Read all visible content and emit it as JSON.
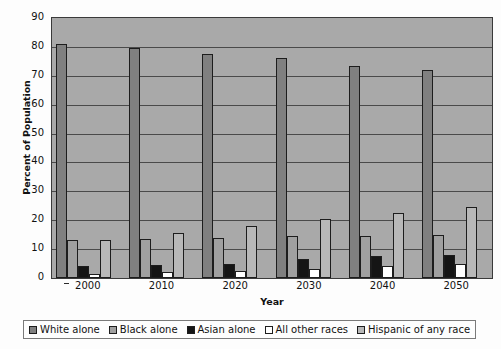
{
  "chart_data": {
    "type": "bar",
    "title": "",
    "xlabel": "Year",
    "ylabel": "Percent of Population",
    "categories": [
      "2000",
      "2010",
      "2020",
      "2030",
      "2040",
      "2050"
    ],
    "ylim": [
      0,
      90
    ],
    "yticks": [
      0,
      10,
      20,
      30,
      40,
      50,
      60,
      70,
      80,
      90
    ],
    "grid": true,
    "legend_position": "bottom",
    "series": [
      {
        "name": "White alone",
        "color": "#808080",
        "values": [
          81,
          79.5,
          77.5,
          76,
          73.5,
          72
        ]
      },
      {
        "name": "Black alone",
        "color": "#a0a0a0",
        "values": [
          13,
          13.5,
          14,
          14.5,
          14.7,
          15
        ]
      },
      {
        "name": "Asian alone",
        "color": "#151515",
        "values": [
          4,
          4.5,
          5,
          6.5,
          7.5,
          8
        ]
      },
      {
        "name": "All other races",
        "color": "#ffffff",
        "values": [
          1.5,
          2,
          2.5,
          3,
          4,
          5
        ]
      },
      {
        "name": "Hispanic of any race",
        "color": "#b8b8b8",
        "values": [
          13,
          15.5,
          18,
          20.5,
          22.5,
          24.5
        ]
      }
    ]
  },
  "axis": {
    "y_title": "Percent of Population",
    "x_title": "Year",
    "y_tick_labels": [
      "90",
      "80",
      "70",
      "60",
      "50",
      "40",
      "30",
      "20",
      "10",
      "0"
    ],
    "x_tick_labels": [
      "2000",
      "2010",
      "2020",
      "2030",
      "2040",
      "2050"
    ]
  },
  "legend": {
    "items": [
      {
        "label": "White alone",
        "color": "#808080"
      },
      {
        "label": "Black alone",
        "color": "#a0a0a0"
      },
      {
        "label": "Asian alone",
        "color": "#151515"
      },
      {
        "label": "All other races",
        "color": "#ffffff"
      },
      {
        "label": "Hispanic of any race",
        "color": "#b8b8b8"
      }
    ]
  },
  "style": {
    "plot_background": "#a9a9a9",
    "gridline_color": "#4a4a4a",
    "border_color": "#3a3a3a",
    "canvas_background": "#fdfdfd"
  }
}
